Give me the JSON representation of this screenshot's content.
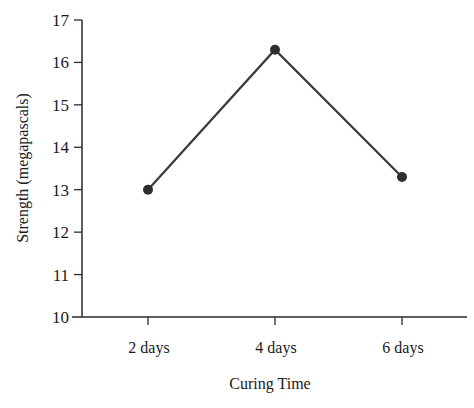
{
  "chart_data": {
    "type": "line",
    "title": "",
    "xlabel": "Curing Time",
    "ylabel": "Strength (megapascals)",
    "categories": [
      "2 days",
      "4 days",
      "6 days"
    ],
    "series": [
      {
        "name": "Strength",
        "values": [
          13.0,
          16.3,
          13.3
        ]
      }
    ],
    "ylim": [
      10,
      17
    ],
    "yticks": [
      10,
      11,
      12,
      13,
      14,
      15,
      16,
      17
    ],
    "grid": false,
    "legend": null
  },
  "colors": {
    "line": "#3a3a3a",
    "marker": "#2e2e2e",
    "axis": "#2a2a2a"
  }
}
